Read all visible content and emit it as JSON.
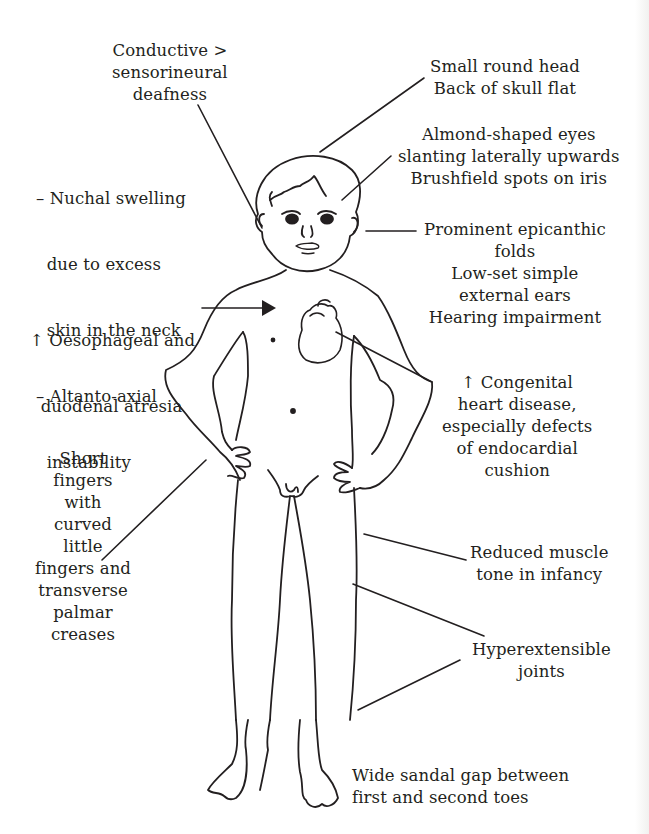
{
  "diagram": {
    "labels": {
      "conductive_deafness": [
        "Conductive >",
        "sensorineural",
        "deafness"
      ],
      "small_head": [
        "Small round head",
        "Back of skull flat"
      ],
      "eyes": [
        "Almond-shaped eyes",
        "slanting laterally upwards",
        "Brushfield spots on iris"
      ],
      "nuchal": [
        "– Nuchal swelling",
        "  due to excess",
        "  skin in the neck",
        "– Altanto-axial",
        "  instability"
      ],
      "epicanthic": [
        "Prominent epicanthic",
        "folds",
        "Low-set simple",
        "external ears",
        "Hearing impairment"
      ],
      "oesophageal": [
        "↑ Oesophageal and",
        "  duodenal atresia"
      ],
      "heart": [
        "↑ Congenital",
        "heart disease,",
        "especially defects",
        "of endocardial",
        "cushion"
      ],
      "fingers": [
        "Short",
        "fingers",
        "with",
        "curved",
        "little",
        "fingers and",
        "transverse",
        "palmar",
        "creases"
      ],
      "muscle": [
        "Reduced muscle",
        "tone in infancy"
      ],
      "joints": [
        "Hyperextensible",
        "joints"
      ],
      "sandal_gap": [
        "Wide sandal gap between",
        "first and second toes"
      ]
    },
    "colors": {
      "ink": "#231f20",
      "background": "#ffffff"
    }
  }
}
